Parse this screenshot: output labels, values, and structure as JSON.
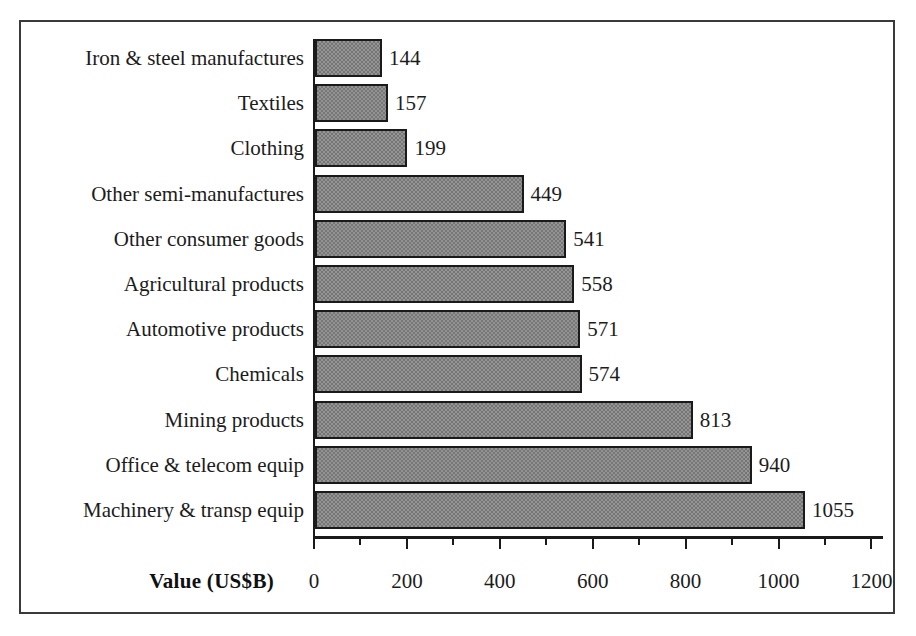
{
  "chart_data": {
    "type": "bar",
    "orientation": "horizontal",
    "title": "",
    "xlabel": "Value (US$B)",
    "ylabel": "",
    "xlim": [
      0,
      1200
    ],
    "xticks": [
      0,
      200,
      400,
      600,
      800,
      1000,
      1200
    ],
    "xtick_labels": [
      "0",
      "200",
      "400",
      "600",
      "800",
      "1000",
      "1200"
    ],
    "minor_ticks": [
      100,
      300,
      500,
      700,
      900,
      1100
    ],
    "grid": false,
    "legend": false,
    "data_labels": true,
    "bar_fill_color": "#767676",
    "bar_edge_color": "#1a1a1a",
    "categories": [
      "Iron & steel manufactures",
      "Textiles",
      "Clothing",
      "Other semi-manufactures",
      "Other consumer goods",
      "Agricultural products",
      "Automotive products",
      "Chemicals",
      "Mining products",
      "Office & telecom equip",
      "Machinery & transp equip"
    ],
    "values": [
      144,
      157,
      199,
      449,
      541,
      558,
      571,
      574,
      813,
      940,
      1055
    ],
    "value_labels": [
      "144",
      "157",
      "199",
      "449",
      "541",
      "558",
      "571",
      "574",
      "813",
      "940",
      "1055"
    ]
  },
  "frame": {
    "border_color": "#3a3a3a"
  },
  "top_clipped_text": "— — — — —"
}
